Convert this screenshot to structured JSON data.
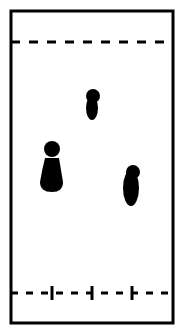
{
  "diagram": {
    "type": "thin-layer-chromatography-plate",
    "colors": {
      "ink": "#000000",
      "background": "#ffffff"
    },
    "plate": {
      "x": 11,
      "y": 11,
      "width": 162,
      "height": 312
    },
    "solvent_front": {
      "y": 42
    },
    "baseline": {
      "y": 293,
      "lanes_x": [
        52,
        92,
        132
      ]
    },
    "spots": [
      {
        "lane": 1,
        "label": "left-spot",
        "cx": 52,
        "head_cy": 149,
        "body_cy": 174
      },
      {
        "lane": 2,
        "label": "middle-spot",
        "cx": 92,
        "head_cy": 96,
        "body_cy": 107
      },
      {
        "lane": 3,
        "label": "right-spot",
        "cx": 131,
        "head_cy": 172,
        "body_cy": 186
      }
    ]
  }
}
